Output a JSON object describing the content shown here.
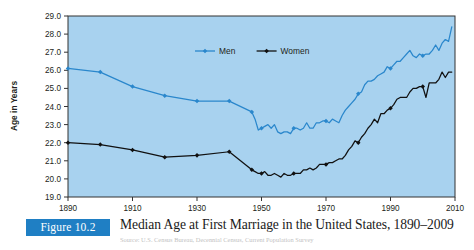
{
  "figure": {
    "badge_label": "Figure 10.2",
    "title": "Median Age at First Marriage in the United States, 1890–2009",
    "source_note": "Source: U.S. Census Bureau, Decennial Census, Current Population Survey",
    "badge_color": "#1f7fc4"
  },
  "chart_data": {
    "type": "line",
    "title": "Median Age at First Marriage in the United States, 1890–2009",
    "xlabel": "",
    "ylabel": "Age in Years",
    "xlim": [
      1890,
      2010
    ],
    "ylim": [
      19.0,
      29.0
    ],
    "grid": false,
    "plot_background": "#a8d2ef",
    "legend_position": "top-center",
    "xticks": [
      1890,
      1910,
      1930,
      1950,
      1970,
      1990,
      2010
    ],
    "yticks": [
      "19.0",
      "20.0",
      "21.0",
      "22.0",
      "23.0",
      "24.0",
      "25.0",
      "26.0",
      "27.0",
      "28.0",
      "29.0"
    ],
    "series": [
      {
        "name": "Men",
        "color": "#2a87cc",
        "marker": "diamond",
        "x": [
          1890,
          1900,
          1910,
          1920,
          1930,
          1940,
          1947,
          1948,
          1949,
          1950,
          1951,
          1952,
          1953,
          1954,
          1955,
          1956,
          1957,
          1958,
          1959,
          1960,
          1961,
          1962,
          1963,
          1964,
          1965,
          1966,
          1967,
          1968,
          1969,
          1970,
          1971,
          1972,
          1973,
          1974,
          1975,
          1976,
          1977,
          1978,
          1979,
          1980,
          1981,
          1982,
          1983,
          1984,
          1985,
          1986,
          1987,
          1988,
          1989,
          1990,
          1991,
          1992,
          1993,
          1994,
          1995,
          1996,
          1997,
          1998,
          1999,
          2000,
          2001,
          2002,
          2003,
          2004,
          2005,
          2006,
          2007,
          2008,
          2009
        ],
        "values": [
          26.1,
          25.9,
          25.1,
          24.6,
          24.3,
          24.3,
          23.7,
          23.3,
          22.7,
          22.8,
          22.9,
          23.0,
          22.8,
          23.0,
          22.6,
          22.5,
          22.6,
          22.6,
          22.5,
          22.8,
          22.8,
          22.7,
          22.8,
          23.1,
          22.8,
          22.8,
          23.1,
          23.1,
          23.2,
          23.2,
          23.1,
          23.3,
          23.2,
          23.1,
          23.5,
          23.8,
          24.0,
          24.2,
          24.4,
          24.7,
          24.8,
          25.2,
          25.4,
          25.4,
          25.5,
          25.7,
          25.8,
          25.9,
          26.2,
          26.1,
          26.3,
          26.5,
          26.5,
          26.7,
          26.9,
          27.1,
          26.8,
          26.7,
          26.9,
          26.8,
          26.9,
          26.9,
          27.1,
          27.4,
          27.1,
          27.5,
          27.7,
          27.6,
          28.4
        ]
      },
      {
        "name": "Women",
        "color": "#111111",
        "marker": "diamond",
        "x": [
          1890,
          1900,
          1910,
          1920,
          1930,
          1940,
          1947,
          1948,
          1949,
          1950,
          1951,
          1952,
          1953,
          1954,
          1955,
          1956,
          1957,
          1958,
          1959,
          1960,
          1961,
          1962,
          1963,
          1964,
          1965,
          1966,
          1967,
          1968,
          1969,
          1970,
          1971,
          1972,
          1973,
          1974,
          1975,
          1976,
          1977,
          1978,
          1979,
          1980,
          1981,
          1982,
          1983,
          1984,
          1985,
          1986,
          1987,
          1988,
          1989,
          1990,
          1991,
          1992,
          1993,
          1994,
          1995,
          1996,
          1997,
          1998,
          1999,
          2000,
          2001,
          2002,
          2003,
          2004,
          2005,
          2006,
          2007,
          2008,
          2009
        ],
        "values": [
          22.0,
          21.9,
          21.6,
          21.2,
          21.3,
          21.5,
          20.5,
          20.4,
          20.3,
          20.3,
          20.4,
          20.2,
          20.2,
          20.3,
          20.2,
          20.1,
          20.3,
          20.2,
          20.2,
          20.3,
          20.3,
          20.3,
          20.5,
          20.5,
          20.6,
          20.5,
          20.6,
          20.8,
          20.8,
          20.8,
          20.9,
          20.9,
          21.0,
          21.1,
          21.1,
          21.3,
          21.6,
          21.8,
          22.1,
          22.0,
          22.3,
          22.5,
          22.8,
          23.0,
          23.3,
          23.1,
          23.6,
          23.6,
          23.8,
          23.9,
          24.1,
          24.4,
          24.5,
          24.5,
          24.5,
          24.8,
          25.0,
          25.0,
          25.1,
          25.1,
          24.5,
          25.3,
          25.3,
          25.3,
          25.5,
          25.9,
          25.6,
          25.9,
          25.9
        ]
      }
    ]
  }
}
